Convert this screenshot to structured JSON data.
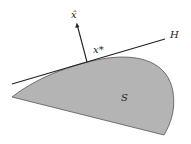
{
  "figure": {
    "labels": {
      "normal": "x̂",
      "point": "x*",
      "hyperplane": "H",
      "set": "S"
    },
    "colors": {
      "set_fill": "#b4b4b4",
      "set_stroke": "#555555",
      "line": "#222222",
      "background": "#ffffff"
    }
  }
}
